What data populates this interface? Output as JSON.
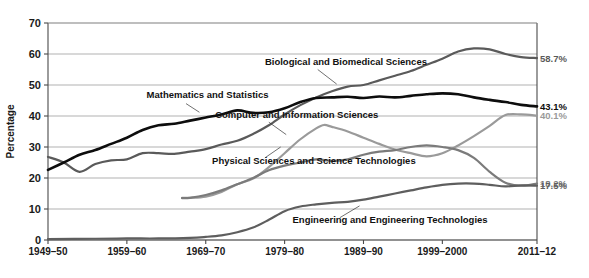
{
  "chart_data": {
    "type": "line",
    "title": "",
    "xlabel": "",
    "ylabel": "Percentage",
    "ylim": [
      0,
      70
    ],
    "ytick_values": [
      0,
      10,
      20,
      30,
      40,
      50,
      60,
      70
    ],
    "ytick_labels": [
      "0",
      "10",
      "20",
      "30",
      "40",
      "50",
      "60",
      "70"
    ],
    "xlim": [
      1949,
      2011
    ],
    "xtick_values": [
      1949,
      1959,
      1969,
      1979,
      1989,
      1999,
      2011
    ],
    "xtick_labels": [
      "1949–50",
      "1959–60",
      "1969–70",
      "1979–80",
      "1989–90",
      "1999–2000",
      "2011–12"
    ],
    "grid": true,
    "legend_position": "inline-annotations",
    "series": [
      {
        "name": "Biological and Biomedical Sciences",
        "color": "#5a5a5a",
        "width": 2.2,
        "end_label": "58.7%",
        "end_value": 58.7,
        "label_x": 1976.5,
        "label_y": 56.5,
        "leader": [
          [
            1983.2,
            55.0
          ],
          [
            1985.6,
            50.3
          ]
        ],
        "x": [
          1949,
          1951,
          1953,
          1955,
          1957,
          1959,
          1961,
          1963,
          1965,
          1967,
          1969,
          1971,
          1973,
          1975,
          1977,
          1979,
          1981,
          1983,
          1985,
          1987,
          1989,
          1991,
          1993,
          1995,
          1997,
          1999,
          2001,
          2003,
          2005,
          2007,
          2009,
          2011
        ],
        "y": [
          26.8,
          25.0,
          22.0,
          24.5,
          25.7,
          26.0,
          28.0,
          28.0,
          27.8,
          28.5,
          29.3,
          30.8,
          32.0,
          34.2,
          37.0,
          40.5,
          43.5,
          46.0,
          48.0,
          49.5,
          50.0,
          51.5,
          53.0,
          54.5,
          56.5,
          58.5,
          60.8,
          61.8,
          61.5,
          60.0,
          59.0,
          58.7
        ]
      },
      {
        "name": "Mathematics and Statistics",
        "color": "#0d0d0d",
        "width": 2.6,
        "end_label": "43.1%",
        "end_value": 43.1,
        "label_x": 1961.5,
        "label_y": 45.8,
        "leader": [
          [
            1966.5,
            44.0
          ],
          [
            1968.2,
            41.2
          ]
        ],
        "x": [
          1949,
          1951,
          1953,
          1955,
          1957,
          1959,
          1961,
          1963,
          1965,
          1967,
          1969,
          1971,
          1973,
          1975,
          1977,
          1979,
          1981,
          1983,
          1985,
          1987,
          1989,
          1991,
          1993,
          1995,
          1997,
          1999,
          2001,
          2003,
          2005,
          2007,
          2009,
          2011
        ],
        "y": [
          22.6,
          25.0,
          27.5,
          29.0,
          31.0,
          33.0,
          35.5,
          37.0,
          37.5,
          38.5,
          39.5,
          40.5,
          41.8,
          41.0,
          41.2,
          42.5,
          44.5,
          45.8,
          46.0,
          46.2,
          45.8,
          46.3,
          46.0,
          46.5,
          47.0,
          47.3,
          47.0,
          46.0,
          45.2,
          44.5,
          43.6,
          43.1
        ]
      },
      {
        "name": "Computer and Information Sciences",
        "color": "#9a9a9a",
        "width": 2.2,
        "end_label": "40.1%",
        "end_value": 40.1,
        "label_x": 1970.2,
        "label_y": 39.5,
        "leader": [
          [
            1977.0,
            38.0
          ],
          [
            1979.2,
            34.0
          ]
        ],
        "x": [
          1966,
          1967,
          1969,
          1971,
          1973,
          1975,
          1977,
          1979,
          1981,
          1983,
          1984,
          1985,
          1987,
          1989,
          1991,
          1993,
          1995,
          1997,
          1999,
          2001,
          2003,
          2005,
          2007,
          2009,
          2011
        ],
        "y": [
          13.6,
          13.6,
          14.0,
          15.5,
          18.0,
          19.8,
          23.5,
          28.0,
          32.5,
          36.0,
          37.1,
          36.5,
          35.0,
          33.0,
          31.0,
          29.2,
          28.0,
          27.0,
          28.0,
          30.5,
          33.5,
          36.8,
          40.3,
          40.5,
          40.1
        ]
      },
      {
        "name": "Physical Sciences and Science Technologies",
        "color": "#7b7b7b",
        "width": 2.2,
        "end_label": "18.2%",
        "end_value": 18.2,
        "label_x": 1969.8,
        "label_y": 24.6,
        "leader": [
          [
            1976.5,
            26.5
          ],
          [
            1978.5,
            30.0
          ]
        ],
        "x": [
          1966,
          1967,
          1969,
          1971,
          1973,
          1975,
          1977,
          1979,
          1981,
          1983,
          1985,
          1987,
          1989,
          1991,
          1993,
          1995,
          1997,
          1999,
          2001,
          2003,
          2005,
          2007,
          2009,
          2011
        ],
        "y": [
          13.5,
          13.6,
          14.5,
          16.0,
          18.0,
          20.0,
          22.5,
          24.0,
          25.0,
          26.0,
          25.5,
          26.0,
          27.5,
          28.5,
          29.0,
          30.0,
          30.5,
          30.0,
          29.0,
          26.5,
          22.0,
          18.5,
          17.5,
          18.2
        ]
      },
      {
        "name": "Engineering and Engineering Technologies",
        "color": "#5e5e5e",
        "width": 2.2,
        "end_label": "17.5%",
        "end_value": 17.5,
        "label_x": 1980.0,
        "label_y": 5.5,
        "leader": [
          [
            1986.0,
            7.2
          ],
          [
            1988.5,
            11.0
          ]
        ],
        "x": [
          1949,
          1955,
          1959,
          1963,
          1967,
          1969,
          1971,
          1973,
          1975,
          1977,
          1979,
          1981,
          1983,
          1985,
          1987,
          1989,
          1991,
          1993,
          1995,
          1997,
          1999,
          2001,
          2003,
          2005,
          2007,
          2009,
          2011
        ],
        "y": [
          0.3,
          0.4,
          0.5,
          0.5,
          0.7,
          1.0,
          1.5,
          2.5,
          4.0,
          6.5,
          9.3,
          10.8,
          11.5,
          12.0,
          12.3,
          13.0,
          14.0,
          15.0,
          16.0,
          17.0,
          17.8,
          18.2,
          18.2,
          17.8,
          17.3,
          17.6,
          17.5
        ]
      }
    ]
  },
  "axis": {
    "y_title": "Percentage"
  }
}
